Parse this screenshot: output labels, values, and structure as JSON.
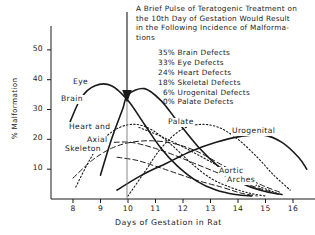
{
  "annotation": {
    "lines": [
      "A Brief Pulse of Teratogenic Treatment on",
      "the 10th Day of Gestation Would Result",
      "in the Following Incidence of Malforma-",
      "tions"
    ],
    "defects": [
      {
        "percent": "35%",
        "label": "Brain Defects"
      },
      {
        "percent": "33%",
        "label": "Eye Defects"
      },
      {
        "percent": "24%",
        "label": "Heart Defects"
      },
      {
        "percent": "18%",
        "label": "Skeletal Defects"
      },
      {
        "percent": "6%",
        "label": "Urogenital Defects"
      },
      {
        "percent": "0%",
        "label": "Palate Defects"
      }
    ]
  },
  "chart_data": {
    "type": "line",
    "title": "",
    "xlabel": "Days of Gestation in Rat",
    "ylabel": "% Malformation",
    "xlim": [
      7.2,
      16.8
    ],
    "ylim": [
      0,
      58
    ],
    "xticks": [
      "8",
      "9",
      "10",
      "11",
      "12",
      "13",
      "14",
      "15",
      "16"
    ],
    "yticks": [
      "10",
      "20",
      "30",
      "40",
      "50"
    ],
    "grid": false,
    "legend_position": "inline-labels",
    "marker_day": 10,
    "series": [
      {
        "name": "Eye",
        "style": "solid",
        "label": "Eye",
        "points": [
          [
            7.9,
            26
          ],
          [
            8.3,
            34
          ],
          [
            8.8,
            38
          ],
          [
            9.4,
            38
          ],
          [
            10.0,
            33
          ],
          [
            10.6,
            25
          ],
          [
            11.2,
            17
          ],
          [
            11.8,
            11
          ],
          [
            12.5,
            6
          ],
          [
            13.2,
            3
          ],
          [
            13.9,
            1.5
          ],
          [
            14.5,
            1
          ]
        ]
      },
      {
        "name": "Brain",
        "style": "solid",
        "label": "Brain",
        "points": [
          [
            9.0,
            8
          ],
          [
            9.4,
            20
          ],
          [
            9.8,
            30
          ],
          [
            10.0,
            35
          ],
          [
            10.6,
            37
          ],
          [
            11.2,
            33
          ],
          [
            11.8,
            26
          ],
          [
            12.6,
            17
          ],
          [
            13.4,
            10
          ],
          [
            14.2,
            5
          ],
          [
            15.0,
            2.5
          ],
          [
            15.6,
            1.5
          ]
        ]
      },
      {
        "name": "Heart",
        "style": "dotted",
        "label": "Heart and",
        "points": [
          [
            8.1,
            4
          ],
          [
            8.6,
            13
          ],
          [
            9.1,
            20
          ],
          [
            9.7,
            24
          ],
          [
            10.3,
            25
          ],
          [
            10.9,
            23
          ],
          [
            11.6,
            18
          ],
          [
            12.3,
            12
          ],
          [
            13.0,
            7
          ],
          [
            13.7,
            4
          ],
          [
            14.4,
            2
          ],
          [
            15.0,
            1
          ]
        ]
      },
      {
        "name": "Axial Skeleton",
        "style": "dashed",
        "label": "Axial Skeleton",
        "points": [
          [
            8.0,
            7
          ],
          [
            8.7,
            13
          ],
          [
            9.4,
            17
          ],
          [
            10.1,
            19
          ],
          [
            10.9,
            19.5
          ],
          [
            11.7,
            18.5
          ],
          [
            12.5,
            16
          ],
          [
            13.3,
            12
          ],
          [
            14.1,
            8
          ],
          [
            14.9,
            4.5
          ],
          [
            15.6,
            2
          ]
        ]
      },
      {
        "name": "Palate",
        "style": "dotted",
        "label": "Palate",
        "points": [
          [
            10.0,
            1
          ],
          [
            10.6,
            9
          ],
          [
            11.2,
            17
          ],
          [
            11.9,
            23
          ],
          [
            12.6,
            25
          ],
          [
            13.3,
            24
          ],
          [
            14.0,
            20
          ],
          [
            14.7,
            14
          ],
          [
            15.3,
            8
          ],
          [
            15.9,
            3
          ]
        ]
      },
      {
        "name": "Urogenital",
        "style": "solid",
        "label": "Urogenital",
        "points": [
          [
            9.6,
            3
          ],
          [
            10.5,
            8
          ],
          [
            11.4,
            12
          ],
          [
            12.3,
            16
          ],
          [
            13.2,
            19
          ],
          [
            14.1,
            21
          ],
          [
            14.9,
            21.5
          ],
          [
            15.6,
            19
          ],
          [
            16.2,
            14
          ],
          [
            16.5,
            10
          ]
        ]
      },
      {
        "name": "Aortic Arches",
        "style": "dashed",
        "label": "Aortic Arches",
        "points": [
          [
            9.5,
            19
          ],
          [
            10.1,
            19
          ],
          [
            10.8,
            17.5
          ],
          [
            11.6,
            15
          ],
          [
            12.4,
            12
          ],
          [
            13.2,
            9
          ],
          [
            14.0,
            6
          ],
          [
            14.8,
            3.5
          ],
          [
            15.5,
            1.5
          ]
        ]
      },
      {
        "name": "Aortic Arches Lower",
        "style": "dashed",
        "label": "",
        "points": [
          [
            9.6,
            14
          ],
          [
            10.3,
            13
          ],
          [
            11.0,
            11
          ],
          [
            11.8,
            8.5
          ],
          [
            12.6,
            6
          ],
          [
            13.4,
            4
          ],
          [
            14.1,
            2
          ],
          [
            14.7,
            1
          ]
        ]
      },
      {
        "name": "Trailing Dotted",
        "style": "dotted",
        "label": "",
        "points": [
          [
            10.4,
            24
          ],
          [
            11.2,
            21
          ],
          [
            12.1,
            17
          ],
          [
            13.0,
            12.5
          ],
          [
            13.9,
            8
          ],
          [
            14.7,
            4.5
          ],
          [
            15.4,
            2
          ]
        ]
      }
    ]
  }
}
